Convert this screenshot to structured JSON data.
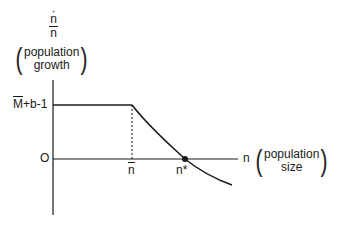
{
  "diagram": {
    "y_axis": {
      "numerator": "n",
      "numerator_dot": "·",
      "denominator": "n",
      "description_line1": "population",
      "description_line2": "growth",
      "paren_open": "(",
      "paren_close": ")"
    },
    "x_axis": {
      "symbol": "n",
      "description_line1": "population",
      "description_line2": "size",
      "paren_open": "(",
      "paren_close": ")"
    },
    "y_ticks": {
      "upper_M": "M",
      "upper_rest": "+b-1",
      "origin": "O"
    },
    "x_ticks": {
      "n_bar": "n",
      "n_star": "n*"
    },
    "colors": {
      "line": "#1a1a1a",
      "background": "#ffffff"
    }
  }
}
